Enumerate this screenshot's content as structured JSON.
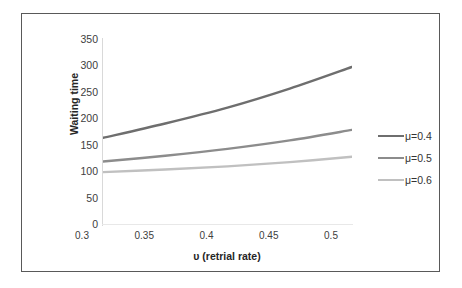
{
  "chart_data": {
    "type": "line",
    "title": "",
    "xlabel": "υ (retrial rate)",
    "ylabel": "Waiting time",
    "x": [
      0.3,
      0.35,
      0.4,
      0.45,
      0.5
    ],
    "xtick_labels": [
      "0.3",
      "0.35",
      "0.4",
      "0.45",
      "0.5"
    ],
    "ytick_labels": [
      "350",
      "300",
      "250",
      "200",
      "150",
      "100",
      "50",
      "0"
    ],
    "yticks": [
      350,
      300,
      250,
      200,
      150,
      100,
      50,
      0
    ],
    "xlim": [
      0.3,
      0.5
    ],
    "ylim": [
      0,
      350
    ],
    "grid": false,
    "legend_position": "right",
    "series": [
      {
        "name": "μ=0.4",
        "color": "#6E6E6E",
        "values": [
          165,
          192,
          222,
          258,
          299
        ]
      },
      {
        "name": "μ=0.5",
        "color": "#8C8C8C",
        "values": [
          120,
          131,
          144,
          160,
          180
        ]
      },
      {
        "name": "μ=0.6",
        "color": "#C0C0C0",
        "values": [
          100,
          105,
          111,
          119,
          129
        ]
      }
    ]
  },
  "legend": {
    "entries": [
      {
        "label": "μ=0.4",
        "color": "#6E6E6E"
      },
      {
        "label": "μ=0.5",
        "color": "#8C8C8C"
      },
      {
        "label": "μ=0.6",
        "color": "#C0C0C0"
      }
    ]
  },
  "frame": {
    "border_color": "#595959"
  }
}
